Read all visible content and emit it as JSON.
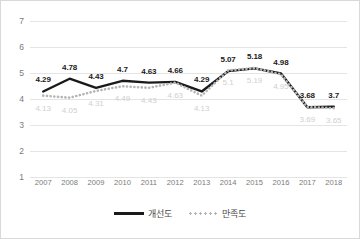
{
  "chart_data": {
    "type": "line",
    "title": "",
    "xlabel": "",
    "ylabel": "",
    "ylim": [
      1,
      7
    ],
    "yticks": [
      "1",
      "2",
      "3",
      "4",
      "5",
      "6",
      "7"
    ],
    "grid": true,
    "legend_position": "bottom",
    "categories": [
      "2007",
      "2008",
      "2009",
      "2010",
      "2011",
      "2012",
      "2013",
      "2014",
      "2015",
      "2016",
      "2017",
      "2018"
    ],
    "series": [
      {
        "name": "개선도",
        "style": "solid",
        "color": "#1a1a1a",
        "values": [
          4.29,
          4.78,
          4.43,
          4.7,
          4.63,
          4.66,
          4.29,
          5.07,
          5.18,
          4.98,
          3.68,
          3.7
        ],
        "labels": [
          "4.29",
          "4.78",
          "4.43",
          "4.7",
          "4.63",
          "4.66",
          "4.29",
          "5.07",
          "5.18",
          "4.98",
          "3.68",
          "3.7"
        ]
      },
      {
        "name": "만족도",
        "style": "dotted",
        "color": "#b5b5b5",
        "values": [
          4.13,
          4.05,
          4.31,
          4.49,
          4.43,
          4.63,
          4.13,
          5.1,
          5.19,
          4.95,
          3.69,
          3.65
        ],
        "labels": [
          "4.13",
          "4.05",
          "4.31",
          "4.49",
          "4.43",
          "4.63",
          "4.13",
          "5.1",
          "5.19",
          "4.95",
          "3.69",
          "3.65"
        ]
      }
    ]
  },
  "legend": {
    "items": [
      {
        "label": "개선도"
      },
      {
        "label": "만족도"
      }
    ]
  }
}
